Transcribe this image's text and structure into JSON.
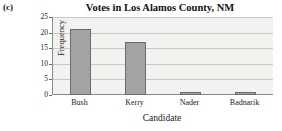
{
  "panel": {
    "label": "(c)"
  },
  "chart_data": {
    "type": "bar",
    "title": "Votes in Los Alamos County, NM",
    "xlabel": "Candidate",
    "ylabel": "Frequency",
    "categories": [
      "Bush",
      "Kerry",
      "Nader",
      "Badnarik"
    ],
    "values": [
      21,
      17,
      1,
      1
    ],
    "ylim": [
      0,
      25
    ],
    "yticks": [
      0,
      5,
      10,
      15,
      20,
      25
    ],
    "ytick_labels": [
      "0",
      "5",
      "10",
      "15",
      "20",
      "25"
    ],
    "grid": "horizontal",
    "legend": "none",
    "bar_color": "#a3a3a3",
    "bar_border_color": "#6b6b6b",
    "plot_background": "#f2f2f0",
    "gridline_color": "#c9c9c6",
    "axis_color": "#8a8a8a"
  }
}
